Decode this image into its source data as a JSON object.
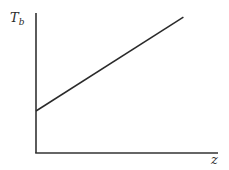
{
  "chart_data": {
    "type": "line",
    "title": "",
    "xlabel": "z",
    "ylabel": "T_b",
    "ylabel_main": "T",
    "ylabel_sub": "b",
    "ticks": {
      "x": [],
      "y": []
    },
    "grid": false,
    "legend": null,
    "series": [
      {
        "name": "T_b vs z",
        "description": "Linear increase with positive intercept",
        "x": [
          0,
          0.81
        ],
        "y": [
          0.3,
          0.97
        ]
      }
    ],
    "xlim": [
      0,
      1
    ],
    "ylim": [
      0,
      1
    ]
  },
  "colors": {
    "axis": "#333333",
    "line": "#2a2a2a",
    "text": "#2a2a2a",
    "background": "#ffffff"
  }
}
